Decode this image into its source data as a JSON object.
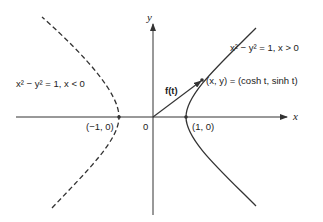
{
  "diagram": {
    "axes": {
      "x_label": "x",
      "y_label": "y",
      "origin_label": "0"
    },
    "points": {
      "left_vertex": "(−1, 0)",
      "right_vertex": "(1, 0)",
      "param_point": "(x, y) = (cosh t, sinh t)"
    },
    "vector": {
      "label": "f(t)"
    },
    "curves": {
      "right_branch": {
        "label": "x² − y² = 1, x > 0",
        "style": "solid"
      },
      "left_branch": {
        "label": "x² − y² = 1, x < 0",
        "style": "dashed"
      }
    },
    "colors": {
      "stroke": "#333333",
      "background": "#ffffff"
    }
  }
}
